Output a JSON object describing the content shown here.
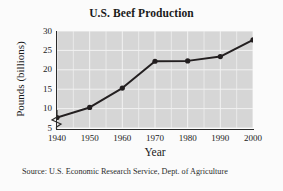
{
  "figure": {
    "background_color": "#fbfbfb",
    "plot_background_color": "#d6d6d6",
    "grid_color": "#f2f2f2",
    "axis_color": "#2b2b2b",
    "series_color": "#231f20"
  },
  "chart_data": {
    "type": "line",
    "title": "U.S. Beef Production",
    "xlabel": "Year",
    "ylabel": "Pounds (billions)",
    "x": [
      1940,
      1950,
      1960,
      1970,
      1980,
      1990,
      2000
    ],
    "categories": [
      "1940",
      "1950",
      "1960",
      "1970",
      "1980",
      "1990",
      "2000"
    ],
    "values": [
      7.7,
      10.3,
      15.3,
      22.2,
      22.3,
      23.4,
      27.7
    ],
    "series": [
      {
        "name": "U.S. Beef Production",
        "values": [
          7.7,
          10.3,
          15.3,
          22.2,
          22.3,
          23.4,
          27.7
        ]
      }
    ],
    "xlim": [
      1940,
      2000
    ],
    "ylim": [
      5,
      30
    ],
    "yticks": [
      5,
      10,
      15,
      20,
      25,
      30
    ],
    "ytick_labels": [
      "5",
      "10",
      "15",
      "20",
      "25",
      "30"
    ],
    "xticks": [
      1940,
      1950,
      1960,
      1970,
      1980,
      1990,
      2000
    ],
    "xtick_labels": [
      "1940",
      "1950",
      "1960",
      "1970",
      "1980",
      "1990",
      "2000"
    ],
    "grid": true,
    "grid_minor_x": true,
    "legend": false,
    "legend_position": "none",
    "y_axis_break": true,
    "marker": "circle",
    "annotations": []
  },
  "source": {
    "text": "Source: U.S. Economic Research Service, Dept. of Agriculture"
  }
}
